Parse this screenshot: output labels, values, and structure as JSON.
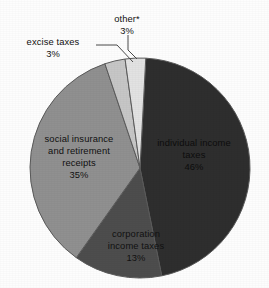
{
  "chart_data": {
    "type": "pie",
    "title": "",
    "subtitle": "",
    "xlabel": "",
    "ylabel": "",
    "legend_position": "none",
    "grid": false,
    "units": "percent",
    "total": 100,
    "categories": [
      "individual income taxes",
      "corporation income taxes",
      "social insurance and retirement receipts",
      "excise taxes",
      "other*"
    ],
    "values": [
      46,
      13,
      35,
      3,
      3
    ],
    "slices": [
      {
        "label": "individual income taxes",
        "label_line1": "individual income",
        "label_line2": "taxes",
        "value": 46,
        "percent_text": "46%",
        "color": "#2e2e2e",
        "label_placement": "inside",
        "has_leader_line": false
      },
      {
        "label": "corporation income taxes",
        "label_line1": "corporation",
        "label_line2": "income taxes",
        "value": 13,
        "percent_text": "13%",
        "color": "#4d4d4d",
        "label_placement": "inside",
        "has_leader_line": false
      },
      {
        "label": "social insurance and retirement receipts",
        "label_line1": "social insurance",
        "label_line2": "and retirement",
        "label_line3": "receipts",
        "value": 35,
        "percent_text": "35%",
        "color": "#909090",
        "label_placement": "inside",
        "has_leader_line": false
      },
      {
        "label": "excise taxes",
        "label_line1": "excise taxes",
        "value": 3,
        "percent_text": "3%",
        "color": "#c6c6c6",
        "label_placement": "outside-left",
        "has_leader_line": true
      },
      {
        "label": "other*",
        "label_line1": "other*",
        "value": 3,
        "percent_text": "3%",
        "color": "#e2e2e2",
        "label_placement": "outside-top",
        "has_leader_line": true
      }
    ],
    "start_angle_deg": 3,
    "direction": "clockwise",
    "stroke_color": "#5a5a5a"
  },
  "figure": {
    "background": "#fdfdfd",
    "center_x": 140,
    "center_y": 168,
    "radius": 110
  }
}
